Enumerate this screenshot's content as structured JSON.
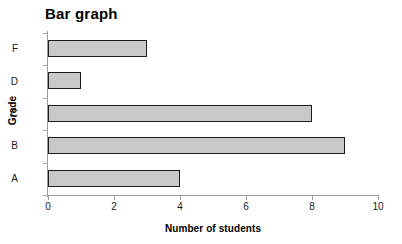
{
  "chart_data": {
    "type": "bar",
    "orientation": "horizontal",
    "title": "Bar graph",
    "xlabel": "Number of students",
    "ylabel": "Grade",
    "categories": [
      "A",
      "B",
      "C",
      "D",
      "F"
    ],
    "values": [
      4,
      9,
      8,
      1,
      3
    ],
    "display_order_top_to_bottom": [
      "F",
      "D",
      "C",
      "B",
      "A"
    ],
    "xlim": [
      0,
      10
    ],
    "xticks": [
      0,
      2,
      4,
      6,
      8,
      10
    ],
    "xtick_labels": [
      "0",
      "2",
      "4",
      "6",
      "8",
      "10"
    ],
    "grid": false,
    "legend": null,
    "bar_fill_color": "#c9c9c9",
    "bar_border_color": "#1c1c1c",
    "axis_color": "#9a9a9a",
    "background_color": "#ffffff",
    "bars": [
      {
        "category": "F",
        "value": 3
      },
      {
        "category": "D",
        "value": 1
      },
      {
        "category": "C",
        "value": 8
      },
      {
        "category": "B",
        "value": 9
      },
      {
        "category": "A",
        "value": 4
      }
    ]
  }
}
